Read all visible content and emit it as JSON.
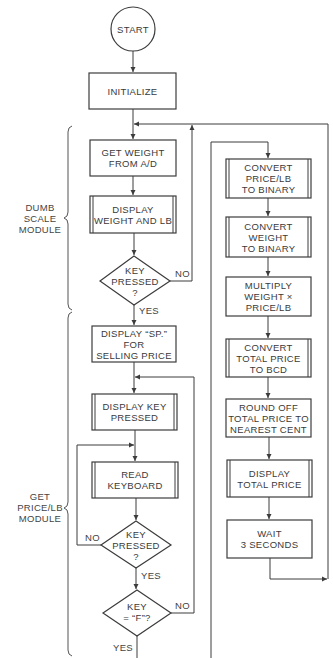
{
  "nodes": {
    "start": {
      "label": "START",
      "shape": "terminator"
    },
    "initialize": {
      "label": "INITIALIZE",
      "shape": "process"
    },
    "get_weight": {
      "line1": "GET WEIGHT",
      "line2": "FROM A/D",
      "shape": "process"
    },
    "display_weight": {
      "line1": "DISPLAY",
      "line2": "WEIGHT AND LB",
      "shape": "predefined-process"
    },
    "key_pressed_1": {
      "line1": "KEY",
      "line2": "PRESSED",
      "line3": "?",
      "shape": "decision"
    },
    "display_sp": {
      "line1": "DISPLAY “SP.”",
      "line2": "FOR",
      "line3": "SELLING PRICE",
      "shape": "process"
    },
    "display_key": {
      "line1": "DISPLAY KEY",
      "line2": "PRESSED",
      "shape": "predefined-process"
    },
    "read_keyboard": {
      "line1": "READ",
      "line2": "KEYBOARD",
      "shape": "predefined-process"
    },
    "key_pressed_2": {
      "line1": "KEY",
      "line2": "PRESSED",
      "line3": "?",
      "shape": "decision"
    },
    "key_f": {
      "line1": "KEY",
      "line2": "= “F”?",
      "shape": "decision"
    },
    "convert_price": {
      "line1": "CONVERT",
      "line2": "PRICE/LB",
      "line3": "TO BINARY",
      "shape": "predefined-process"
    },
    "convert_weight": {
      "line1": "CONVERT",
      "line2": "WEIGHT",
      "line3": "TO BINARY",
      "shape": "predefined-process"
    },
    "multiply": {
      "line1": "MULTIPLY",
      "line2": "WEIGHT ×",
      "line3": "PRICE/LB",
      "shape": "process"
    },
    "convert_total": {
      "line1": "CONVERT",
      "line2": "TOTAL PRICE",
      "line3": "TO BCD",
      "shape": "predefined-process"
    },
    "round_off": {
      "line1": "ROUND OFF",
      "line2": "TOTAL PRICE TO",
      "line3": "NEAREST CENT",
      "shape": "process"
    },
    "display_total": {
      "line1": "DISPLAY",
      "line2": "TOTAL PRICE",
      "shape": "predefined-process"
    },
    "wait": {
      "line1": "WAIT",
      "line2": "3 SECONDS",
      "shape": "process"
    }
  },
  "edge_labels": {
    "kp1_no": "NO",
    "kp1_yes": "YES",
    "kp2_no": "NO",
    "kp2_yes": "YES",
    "kf_no": "NO",
    "kf_yes": "YES"
  },
  "modules": {
    "dumb_scale": {
      "line1": "DUMB",
      "line2": "SCALE",
      "line3": "MODULE"
    },
    "get_price": {
      "line1": "GET",
      "line2": "PRICE/LB",
      "line3": "MODULE"
    }
  },
  "colors": {
    "stroke": "#3c3c3c",
    "text": "#3a3a3a",
    "background": "#ffffff"
  }
}
